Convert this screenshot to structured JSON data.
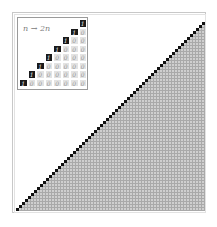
{
  "diagram": {
    "type": "cellular-automaton-style triangular grid",
    "inset": {
      "label": "n → 2n",
      "rows": 8,
      "cell_on_value": "1",
      "cell_off_value": "0",
      "rows_data": [
        [
          "1"
        ],
        [
          "1",
          "0"
        ],
        [
          "1",
          "0",
          "0"
        ],
        [
          "1",
          "0",
          "0",
          "0"
        ],
        [
          "1",
          "0",
          "0",
          "0",
          "0"
        ],
        [
          "1",
          "0",
          "0",
          "0",
          "0",
          "0"
        ],
        [
          "1",
          "0",
          "0",
          "0",
          "0",
          "0",
          "0"
        ],
        [
          "1",
          "0",
          "0",
          "0",
          "0",
          "0",
          "0",
          "0"
        ]
      ]
    },
    "main_grid": {
      "size": 63,
      "pattern": "black diagonal from bottom-left to top-right; gray cells below-right of diagonal; white above-left",
      "colors": {
        "on": "#111111",
        "off": "#cfcfcf",
        "gridline": "#a9a9a9",
        "empty": "#ffffff"
      }
    }
  }
}
